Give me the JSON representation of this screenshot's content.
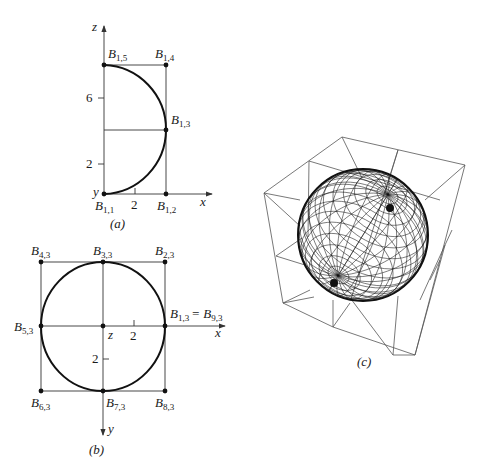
{
  "figure": {
    "panels": [
      {
        "id": "a",
        "caption": "(a)",
        "axes": {
          "vertical": "z",
          "horizontal": "x",
          "origin_label": "y"
        },
        "ticks": {
          "z": [
            "2",
            "6"
          ],
          "x": [
            "2"
          ]
        },
        "points": [
          {
            "name": "B",
            "sub": "1,1"
          },
          {
            "name": "B",
            "sub": "1,2"
          },
          {
            "name": "B",
            "sub": "1,3"
          },
          {
            "name": "B",
            "sub": "1,4"
          },
          {
            "name": "B",
            "sub": "1,5"
          }
        ]
      },
      {
        "id": "b",
        "caption": "(b)",
        "axes": {
          "vertical": "y",
          "horizontal": "x",
          "origin_label": "z"
        },
        "ticks": {
          "x": [
            "2"
          ],
          "y": [
            "2"
          ]
        },
        "points": [
          {
            "name": "B",
            "sub": "1,3",
            "eq": "= B",
            "eq_sub": "9,3"
          },
          {
            "name": "B",
            "sub": "2,3"
          },
          {
            "name": "B",
            "sub": "3,3"
          },
          {
            "name": "B",
            "sub": "4,3"
          },
          {
            "name": "B",
            "sub": "5,3"
          },
          {
            "name": "B",
            "sub": "6,3"
          },
          {
            "name": "B",
            "sub": "7,3"
          },
          {
            "name": "B",
            "sub": "8,3"
          }
        ]
      },
      {
        "id": "c",
        "caption": "(c)",
        "description": "wireframe sphere inside control-point cube"
      }
    ]
  }
}
